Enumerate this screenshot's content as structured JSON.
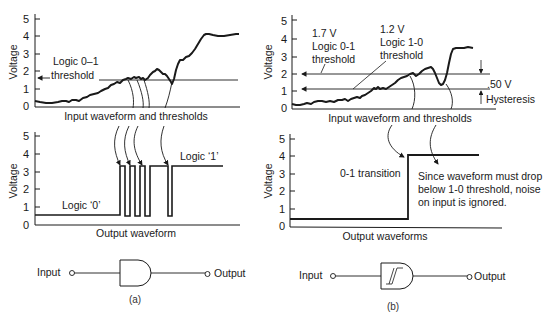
{
  "panel_a": {
    "caption": "(a)",
    "input_chart": {
      "ylabel": "Voltage",
      "ticks": [
        "0",
        "1",
        "2",
        "3",
        "4",
        "5"
      ],
      "threshold_label_line1": "Logic 0–1",
      "threshold_label_line2": "threshold",
      "xlabel": "Input waveform and thresholds"
    },
    "output_chart": {
      "ylabel": "Voltage",
      "ticks": [
        "0",
        "1",
        "2",
        "3",
        "4",
        "5"
      ],
      "low_label": "Logic ‘0’",
      "high_label": "Logic ‘1’",
      "xlabel": "Output waveform"
    },
    "gate": {
      "input_label": "Input",
      "output_label": "Output",
      "symbol": "and-gate-shape"
    }
  },
  "panel_b": {
    "caption": "(b)",
    "input_chart": {
      "ylabel": "Voltage",
      "ticks": [
        "0",
        "1",
        "2",
        "3",
        "4",
        "5"
      ],
      "upper_threshold_value": "1.7 V",
      "upper_threshold_line1": "Logic 0-1",
      "upper_threshold_line2": "threshold",
      "lower_threshold_value": "1.2 V",
      "lower_threshold_line1": "Logic 1-0",
      "lower_threshold_line2": "threshold",
      "hysteresis_value": ".50 V",
      "hysteresis_label": "Hysteresis",
      "xlabel": "Input waveform and thresholds"
    },
    "output_chart": {
      "ylabel": "Voltage",
      "ticks": [
        "0",
        "1",
        "2",
        "3",
        "4",
        "5"
      ],
      "transition_label": "0-1 transition",
      "note_line1": "Since waveform must drop",
      "note_line2": "below 1-0 threshold, noise",
      "note_line3": "on input is ignored.",
      "xlabel": "Output waveforms"
    },
    "gate": {
      "input_label": "Input",
      "output_label": "Output",
      "symbol": "schmitt-trigger-shape"
    }
  },
  "colors": {
    "ink": "#1a1a1a",
    "background": "#ffffff"
  }
}
